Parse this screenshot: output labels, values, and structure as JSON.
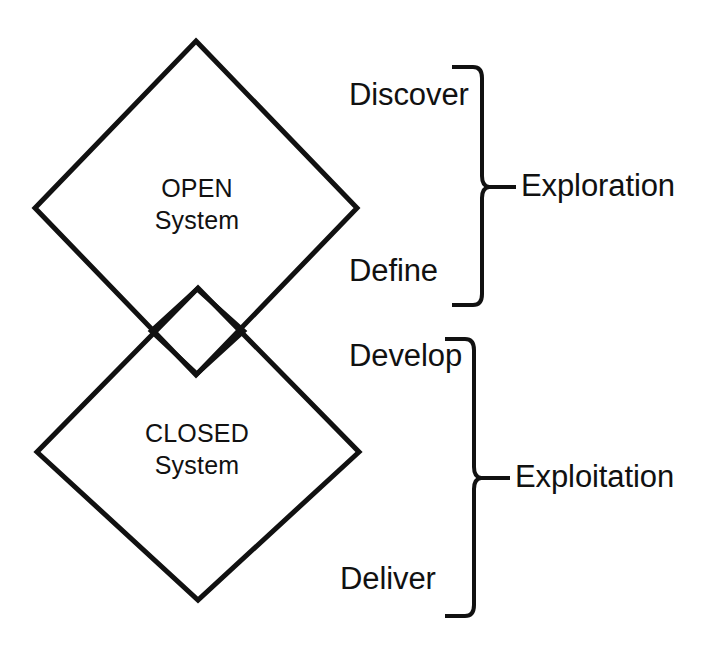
{
  "diagram": {
    "background_color": "#ffffff",
    "stroke_color": "#111111",
    "shapes": [
      {
        "name": "open-system-diamond",
        "label_line1": "OPEN",
        "label_line2": "System"
      },
      {
        "name": "overlap-diamond",
        "label_line1": "",
        "label_line2": ""
      },
      {
        "name": "closed-system-diamond",
        "label_line1": "CLOSED",
        "label_line2": "System"
      }
    ],
    "open_system": {
      "line1": "OPEN",
      "line2": "System"
    },
    "closed_system": {
      "line1": "CLOSED",
      "line2": "System"
    },
    "phases": [
      {
        "id": "discover",
        "label": "Discover"
      },
      {
        "id": "define",
        "label": "Define"
      },
      {
        "id": "develop",
        "label": "Develop"
      },
      {
        "id": "deliver",
        "label": "Deliver"
      }
    ],
    "groups": [
      {
        "id": "exploration",
        "label": "Exploration",
        "phases": [
          "Discover",
          "Define"
        ]
      },
      {
        "id": "exploitation",
        "label": "Exploitation",
        "phases": [
          "Develop",
          "Deliver"
        ]
      }
    ]
  }
}
